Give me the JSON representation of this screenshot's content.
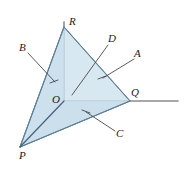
{
  "figure": {
    "canvas": {
      "width": 188,
      "height": 173,
      "background": "#ffffff"
    },
    "colors": {
      "face_fill": "#cde1ed",
      "face_fill_dark": "#c2dae9",
      "edge_stroke": "#6f8fa3",
      "axis_stroke": "#8c8c8c",
      "leader_stroke": "#4a4a4a",
      "label_text": "#1a1a1a"
    },
    "vertices": [
      {
        "id": "R",
        "label": "R",
        "x": 64,
        "y": 27,
        "label_x": 69,
        "label_y": 16
      },
      {
        "id": "O",
        "label": "O",
        "x": 64,
        "y": 101,
        "label_x": 52,
        "label_y": 94
      },
      {
        "id": "Q",
        "label": "Q",
        "x": 130,
        "y": 101,
        "label_x": 131,
        "label_y": 87
      },
      {
        "id": "P",
        "label": "P",
        "x": 20,
        "y": 147,
        "label_x": 19,
        "label_y": 150
      }
    ],
    "faces": [
      {
        "id": "face-PQR",
        "name": "front-face-A",
        "points": "64,27 130,101 20,147",
        "fill": "#cde1ed"
      },
      {
        "id": "face-POR",
        "name": "left-face-B",
        "points": "64,27 64,101 20,147",
        "fill": "#c6dcea"
      },
      {
        "id": "face-POQ",
        "name": "bottom-face-C",
        "points": "64,101 130,101 20,147",
        "fill": "#c2dae9"
      }
    ],
    "edges": [
      {
        "id": "edge-RQ",
        "name": "edge-R-Q",
        "x1": 64,
        "y1": 27,
        "x2": 130,
        "y2": 101
      },
      {
        "id": "edge-RP",
        "name": "edge-R-P",
        "x1": 64,
        "y1": 27,
        "x2": 20,
        "y2": 147
      },
      {
        "id": "edge-PQ",
        "name": "edge-P-Q",
        "x1": 20,
        "y1": 147,
        "x2": 130,
        "y2": 101
      },
      {
        "id": "edge-PO",
        "name": "edge-P-O",
        "x1": 20,
        "y1": 147,
        "x2": 64,
        "y2": 101
      }
    ],
    "axes": [
      {
        "id": "axis-vertical",
        "name": "axis-OR-vertical",
        "x1": 64,
        "y1": 101,
        "x2": 64,
        "y2": 22
      },
      {
        "id": "axis-horizontal",
        "name": "axis-OQ-horizontal",
        "x1": 64,
        "y1": 101,
        "x2": 178,
        "y2": 101
      }
    ],
    "leaders": [
      {
        "id": "leader-B",
        "name": "leader-line-B",
        "x1": 28,
        "y1": 53,
        "x2": 55,
        "y2": 82
      },
      {
        "id": "leader-D",
        "name": "leader-line-D",
        "x1": 108,
        "y1": 45,
        "x2": 72,
        "y2": 95
      },
      {
        "id": "leader-A",
        "name": "leader-line-A",
        "x1": 134,
        "y1": 59,
        "x2": 103,
        "y2": 78
      },
      {
        "id": "leader-C",
        "name": "leader-line-C",
        "x1": 115,
        "y1": 131,
        "x2": 86,
        "y2": 112
      }
    ],
    "ticks": [
      {
        "id": "tick-B",
        "name": "tick-mark-B",
        "x1": 50,
        "y1": 83,
        "x2": 58,
        "y2": 80
      },
      {
        "id": "tick-A",
        "name": "tick-mark-A",
        "x1": 98,
        "y1": 79,
        "x2": 106,
        "y2": 76
      },
      {
        "id": "tick-C",
        "name": "tick-mark-C",
        "x1": 82,
        "y1": 110,
        "x2": 90,
        "y2": 113
      }
    ],
    "face_labels": [
      {
        "id": "label-B",
        "label": "B",
        "x": 19,
        "y": 42
      },
      {
        "id": "label-D",
        "label": "D",
        "x": 108,
        "y": 33
      },
      {
        "id": "label-A",
        "label": "A",
        "x": 134,
        "y": 48
      },
      {
        "id": "label-C",
        "label": "C",
        "x": 116,
        "y": 128
      }
    ]
  }
}
